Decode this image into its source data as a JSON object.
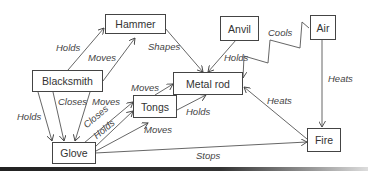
{
  "diagram": {
    "type": "concept-map",
    "nodes": [
      {
        "id": "hammer",
        "label": "Hammer"
      },
      {
        "id": "blacksmith",
        "label": "Blacksmith"
      },
      {
        "id": "anvil",
        "label": "Anvil"
      },
      {
        "id": "air",
        "label": "Air"
      },
      {
        "id": "metal_rod",
        "label": "Metal rod"
      },
      {
        "id": "tongs",
        "label": "Tongs"
      },
      {
        "id": "glove",
        "label": "Glove"
      },
      {
        "id": "fire",
        "label": "Fire"
      }
    ],
    "edges": [
      {
        "from": "blacksmith",
        "to": "hammer",
        "label": "Holds"
      },
      {
        "from": "blacksmith",
        "to": "hammer",
        "label": "Moves"
      },
      {
        "from": "hammer",
        "to": "metal_rod",
        "label": "Shapes"
      },
      {
        "from": "anvil",
        "to": "metal_rod",
        "label": "Holds"
      },
      {
        "from": "air",
        "to": "metal_rod",
        "label": "Cools"
      },
      {
        "from": "air",
        "to": "fire",
        "label": "Heats"
      },
      {
        "from": "fire",
        "to": "metal_rod",
        "label": "Heats"
      },
      {
        "from": "blacksmith",
        "to": "glove",
        "label": "Holds"
      },
      {
        "from": "blacksmith",
        "to": "glove",
        "label": "Closes"
      },
      {
        "from": "blacksmith",
        "to": "glove",
        "label": "Moves"
      },
      {
        "from": "glove",
        "to": "tongs",
        "label": "Closes"
      },
      {
        "from": "glove",
        "to": "tongs",
        "label": "Holds"
      },
      {
        "from": "glove",
        "to": "tongs",
        "label": "Moves"
      },
      {
        "from": "tongs",
        "to": "metal_rod",
        "label": "Moves"
      },
      {
        "from": "tongs",
        "to": "metal_rod",
        "label": "Holds"
      },
      {
        "from": "glove",
        "to": "fire",
        "label": "Stops"
      }
    ],
    "colors": {
      "line": "#444444",
      "text": "#333333",
      "background": "#ffffff"
    }
  }
}
